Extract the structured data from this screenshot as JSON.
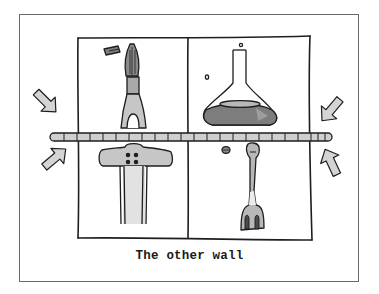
{
  "caption": "The other wall",
  "colors": {
    "line": "#1e1e1e",
    "fill_light": "#cfcfcf",
    "fill_mid": "#a9a9a9",
    "fill_dark": "#7d7d7d",
    "frame": "#6a6a6a"
  },
  "panels": [
    {
      "id": "top-left",
      "object": "paintbrush-icon"
    },
    {
      "id": "top-right",
      "object": "flask-icon"
    },
    {
      "id": "bottom-left",
      "object": "t-bracket-icon"
    },
    {
      "id": "bottom-right",
      "object": "fork-icon"
    }
  ],
  "arrows": [
    {
      "id": "left-upper",
      "direction": "down-right"
    },
    {
      "id": "left-lower",
      "direction": "up-right"
    },
    {
      "id": "right-upper",
      "direction": "down-left"
    },
    {
      "id": "right-lower",
      "direction": "up-left"
    }
  ]
}
